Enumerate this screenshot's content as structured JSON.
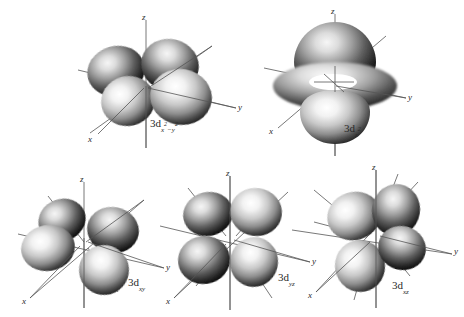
{
  "figure": {
    "background_color": "#ffffff",
    "ink_color": "#2a2a2a",
    "width": 464,
    "height": 317,
    "axis_labels": {
      "x": "x",
      "y": "y",
      "z": "z"
    }
  },
  "orbitals": [
    {
      "id": "3d-x2-y2",
      "name": "3d x squared minus y squared orbital",
      "label_prefix": "3d",
      "label_sub_main": "x",
      "label_sub_sup1": "2",
      "label_sub_mid": "−y",
      "label_sub_sup2": "2",
      "label_plain": "3d(x²−y²)",
      "lobe_count": 4,
      "has_torus": false,
      "axes": {
        "x": "x",
        "y": "y",
        "z": "z"
      },
      "position": {
        "left": 60,
        "top": 8,
        "width": 200,
        "height": 150
      },
      "label_position": {
        "left": 150,
        "top": 117
      }
    },
    {
      "id": "3d-z2",
      "name": "3d z squared orbital",
      "label_prefix": "3d",
      "label_sub_main": "z",
      "label_sub_sup1": "2",
      "label_sub_mid": "",
      "label_sub_sup2": "",
      "label_plain": "3d(z²)",
      "lobe_count": 2,
      "has_torus": true,
      "axes": {
        "x": "x",
        "y": "y",
        "z": "z"
      },
      "position": {
        "left": 258,
        "top": 6,
        "width": 200,
        "height": 155
      },
      "label_position": {
        "left": 344,
        "top": 122
      }
    },
    {
      "id": "3d-xy",
      "name": "3d xy orbital",
      "label_prefix": "3d",
      "label_sub_main": "xy",
      "label_sub_sup1": "",
      "label_sub_mid": "",
      "label_sub_sup2": "",
      "label_plain": "3d(xy)",
      "lobe_count": 4,
      "has_torus": false,
      "axes": {
        "x": "x",
        "y": "y",
        "z": "z"
      },
      "position": {
        "left": 18,
        "top": 172,
        "width": 180,
        "height": 145
      },
      "label_position": {
        "left": 128,
        "top": 276
      }
    },
    {
      "id": "3d-yz",
      "name": "3d yz orbital",
      "label_prefix": "3d",
      "label_sub_main": "yz",
      "label_sub_sup1": "",
      "label_sub_mid": "",
      "label_sub_sup2": "",
      "label_plain": "3d(yz)",
      "lobe_count": 4,
      "has_torus": false,
      "axes": {
        "x": "x",
        "y": "y",
        "z": "z"
      },
      "position": {
        "left": 160,
        "top": 170,
        "width": 180,
        "height": 147
      },
      "label_position": {
        "left": 278,
        "top": 271
      }
    },
    {
      "id": "3d-xz",
      "name": "3d xz orbital",
      "label_prefix": "3d",
      "label_sub_main": "xz",
      "label_sub_sup1": "",
      "label_sub_mid": "",
      "label_sub_sup2": "",
      "label_plain": "3d(xz)",
      "lobe_count": 4,
      "has_torus": false,
      "axes": {
        "x": "x",
        "y": "y",
        "z": "z"
      },
      "position": {
        "left": 292,
        "top": 168,
        "width": 175,
        "height": 149
      },
      "label_position": {
        "left": 392,
        "top": 279
      }
    }
  ]
}
